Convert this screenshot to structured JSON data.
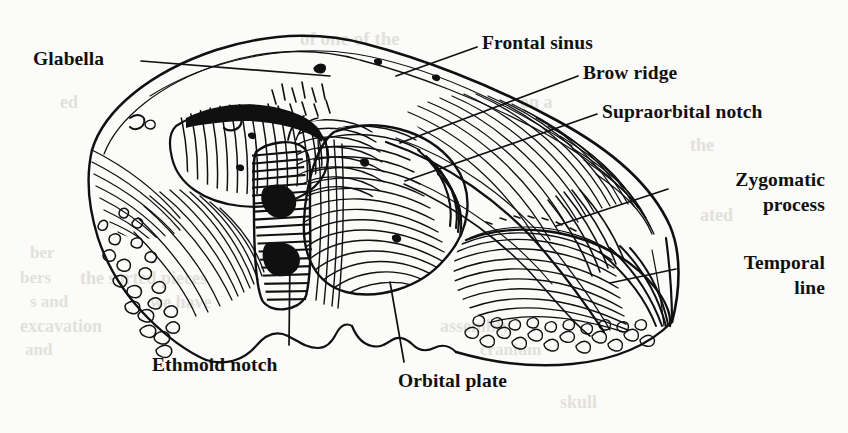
{
  "figure": {
    "view": "inferior posterior view",
    "style": "line engraving",
    "ink_color": "#111010",
    "paper_color": "#fbfbf9",
    "width": 848,
    "height": 433
  },
  "labels": [
    {
      "id": "glabella",
      "text": "Glabella",
      "x": 33,
      "y": 46,
      "align": "left",
      "leader": "M 141 61 L 330 76"
    },
    {
      "id": "frontal-sinus",
      "text": "Frontal sinus",
      "x": 482,
      "y": 30,
      "align": "left",
      "leader": "M 477 47 L 396 76"
    },
    {
      "id": "brow-ridge",
      "text": "Brow ridge",
      "x": 583,
      "y": 60,
      "align": "left",
      "leader": "M 578 76 L 400 143"
    },
    {
      "id": "supraorbital-notch",
      "text": "Supraorbital notch",
      "x": 602,
      "y": 99,
      "align": "left",
      "leader": "M 597 114 L 405 181"
    },
    {
      "id": "zygomatic-process",
      "text": "Zygomatic\nprocess",
      "line1": "Zygomatic",
      "line2": "process",
      "x": 673,
      "y": 167,
      "align": "right",
      "leader": "M 668 189 L 556 226"
    },
    {
      "id": "temporal-line",
      "text": "Temporal\nline",
      "line1": "Temporal",
      "line2": "line",
      "x": 681,
      "y": 250,
      "align": "right",
      "leader": "M 676 269 L 610 283"
    },
    {
      "id": "ethmoid-notch",
      "text": "Ethmoid notch",
      "x": 152,
      "y": 352,
      "align": "left",
      "leader": "M 289 345 L 290 255"
    },
    {
      "id": "orbital-plate",
      "text": "Orbital plate",
      "x": 398,
      "y": 368,
      "align": "left",
      "leader": "M 404 362 L 390 282"
    }
  ],
  "showthrough_text": [
    {
      "text": "of one of the",
      "x": 300,
      "y": 28,
      "size": 19
    },
    {
      "text": "on a",
      "x": 520,
      "y": 92,
      "size": 18
    },
    {
      "text": "ed",
      "x": 60,
      "y": 92,
      "size": 18
    },
    {
      "text": "the",
      "x": 690,
      "y": 135,
      "size": 18
    },
    {
      "text": "ated",
      "x": 700,
      "y": 205,
      "size": 18
    },
    {
      "text": "ber",
      "x": 30,
      "y": 243,
      "size": 17
    },
    {
      "text": "bers",
      "x": 20,
      "y": 268,
      "size": 17
    },
    {
      "text": "the sorted pieces",
      "x": 80,
      "y": 268,
      "size": 18
    },
    {
      "text": "s and",
      "x": 30,
      "y": 292,
      "size": 17
    },
    {
      "text": "we have",
      "x": 150,
      "y": 292,
      "size": 18
    },
    {
      "text": "excavation",
      "x": 20,
      "y": 316,
      "size": 18
    },
    {
      "text": "assembly",
      "x": 440,
      "y": 316,
      "size": 18
    },
    {
      "text": "and",
      "x": 25,
      "y": 340,
      "size": 17
    },
    {
      "text": "cranium",
      "x": 480,
      "y": 340,
      "size": 17
    },
    {
      "text": "skull",
      "x": 560,
      "y": 392,
      "size": 18
    }
  ]
}
